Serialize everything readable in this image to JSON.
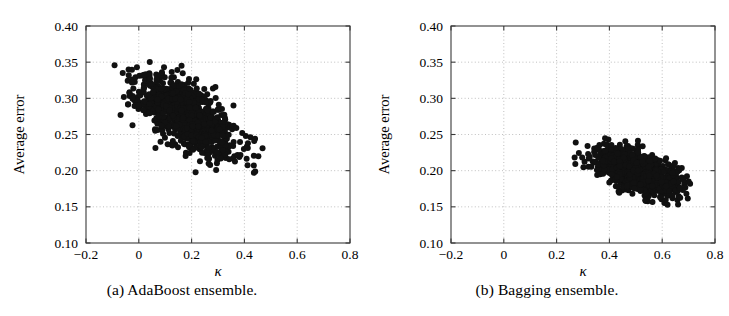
{
  "figure": {
    "panel_count": 2,
    "background": "#ffffff",
    "marker_color": "#111111"
  },
  "panels": [
    {
      "id": "a",
      "caption": "(a) AdaBoost ensemble.",
      "chart_index": 0
    },
    {
      "id": "b",
      "caption": "(b) Bagging ensemble.",
      "chart_index": 1
    }
  ],
  "chart_data": [
    {
      "type": "scatter",
      "title": "(a) AdaBoost ensemble.",
      "xlabel": "κ",
      "ylabel": "Average error",
      "xlim": [
        -0.2,
        0.8
      ],
      "ylim": [
        0.1,
        0.4
      ],
      "xticks": [
        -0.2,
        0,
        0.2,
        0.4,
        0.6,
        0.8
      ],
      "xticklabels": [
        "−0.2",
        "0",
        "0.2",
        "0.4",
        "0.6",
        "0.8"
      ],
      "yticks": [
        0.1,
        0.15,
        0.2,
        0.25,
        0.3,
        0.35,
        0.4
      ],
      "yticklabels": [
        "0.10",
        "0.15",
        "0.20",
        "0.25",
        "0.30",
        "0.35",
        "0.40"
      ],
      "grid": true,
      "grid_style": "dotted",
      "grid_color": "#b9b9b9",
      "legend": false,
      "marker": "filled-circle",
      "marker_color": "#111111",
      "marker_size": 3.0,
      "n_points": 1000,
      "x_range_observed": [
        -0.105,
        0.525
      ],
      "y_range_observed": [
        0.195,
        0.356
      ],
      "centroid": [
        0.178,
        0.277
      ],
      "correlation": -0.62,
      "x_mean": 0.178,
      "x_std": 0.093,
      "y_mean": 0.277,
      "y_std": 0.027,
      "seed": 1337
    },
    {
      "type": "scatter",
      "title": "(b) Bagging ensemble.",
      "xlabel": "κ",
      "ylabel": "Average error",
      "xlim": [
        -0.2,
        0.8
      ],
      "ylim": [
        0.1,
        0.4
      ],
      "xticks": [
        -0.2,
        0,
        0.2,
        0.4,
        0.6,
        0.8
      ],
      "xticklabels": [
        "−0.2",
        "0",
        "0.2",
        "0.4",
        "0.6",
        "0.8"
      ],
      "yticks": [
        0.1,
        0.15,
        0.2,
        0.25,
        0.3,
        0.35,
        0.4
      ],
      "yticklabels": [
        "0.10",
        "0.15",
        "0.20",
        "0.25",
        "0.30",
        "0.35",
        "0.40"
      ],
      "grid": true,
      "grid_style": "dotted",
      "grid_color": "#b9b9b9",
      "legend": false,
      "marker": "filled-circle",
      "marker_color": "#111111",
      "marker_size": 3.0,
      "n_points": 1000,
      "x_range_observed": [
        0.192,
        0.718
      ],
      "y_range_observed": [
        0.152,
        0.246
      ],
      "centroid": [
        0.502,
        0.199
      ],
      "correlation": -0.55,
      "x_mean": 0.502,
      "x_std": 0.079,
      "y_mean": 0.199,
      "y_std": 0.016,
      "seed": 20242
    }
  ],
  "axes_geometry": {
    "plot_left": 86,
    "plot_right": 350,
    "plot_top": 26,
    "plot_bottom": 243,
    "panel_b_offset": 366
  }
}
